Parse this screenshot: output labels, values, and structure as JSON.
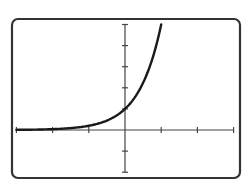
{
  "chart_data": {
    "type": "line",
    "title": "",
    "xlabel": "",
    "ylabel": "",
    "function": "y = 5^x",
    "xlim": [
      -3,
      3
    ],
    "ylim": [
      -2,
      5
    ],
    "x_ticks": [
      -3,
      -2,
      -1,
      0,
      1,
      2,
      3
    ],
    "y_ticks": [
      -2,
      -1,
      0,
      1,
      2,
      3,
      4,
      5
    ],
    "grid": false,
    "legend": null,
    "series": [
      {
        "name": "curve",
        "x": [
          -3,
          -2.5,
          -2,
          -1.5,
          -1,
          -0.5,
          0,
          0.25,
          0.5,
          0.75,
          1
        ],
        "y": [
          0.008,
          0.018,
          0.04,
          0.089,
          0.2,
          0.447,
          1,
          1.495,
          2.236,
          3.344,
          5
        ]
      }
    ],
    "annotations": [
      {
        "text": "y-intercept (0, 1)",
        "x": 0,
        "y": 1
      }
    ]
  },
  "style": {
    "frame_color": "#333333",
    "axis_color": "#444444",
    "curve_color": "#1a1a1a",
    "background": "#ffffff"
  },
  "layout": {
    "frame": {
      "x": 12,
      "y": 19,
      "w": 228,
      "h": 159,
      "r": 6
    },
    "origin_px": {
      "x": 125,
      "y": 130
    },
    "unit_px": {
      "x": 36.2,
      "y": 21.1
    }
  }
}
